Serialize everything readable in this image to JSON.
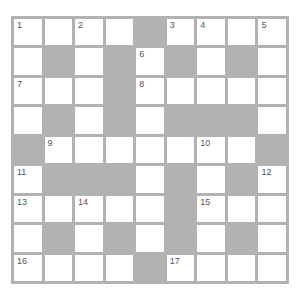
{
  "puzzle": {
    "rows": 9,
    "cols": 9,
    "colors": {
      "grid_line": "#b2b2b2",
      "block": "#b2b2b2",
      "cell": "#ffffff",
      "number": "#555555"
    },
    "layout": [
      "WWWWBWWWW",
      "WBWBWBWBW",
      "WWWBWWWWW",
      "WBWBWBBBW",
      "BWWWWWWWB",
      "WBBBWBWBW",
      "WWWWWBWWW",
      "WBWBWBWBW",
      "WWWWBWWWW"
    ],
    "numbers": {
      "0-0": "1",
      "0-2": "2",
      "0-5": "3",
      "0-6": "4",
      "0-8": "5",
      "1-4": "6",
      "2-0": "7",
      "2-4": "8",
      "4-1": "9",
      "4-6": "10",
      "5-0": "11",
      "5-8": "12",
      "6-0": "13",
      "6-2": "14",
      "6-6": "15",
      "8-0": "16",
      "8-5": "17"
    }
  }
}
